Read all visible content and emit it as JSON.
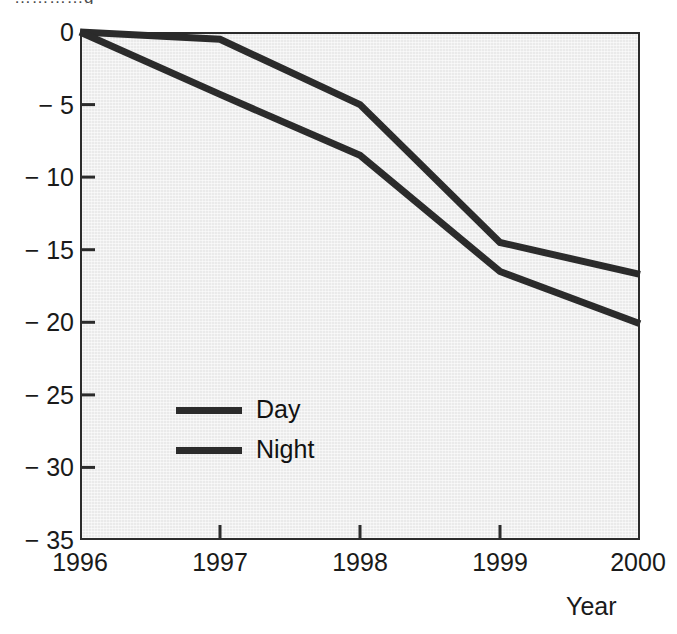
{
  "figure": {
    "title_remnant": "…………g",
    "background": "#ffffff",
    "panel_background": "#eaeaea",
    "axis_color": "#2b2b2b",
    "xaxis_title": "Year"
  },
  "legend": {
    "position": "inside-center-left",
    "entries": [
      {
        "label": "Day",
        "color": "#2b2b2b"
      },
      {
        "label": "Night",
        "color": "#2b2b2b"
      }
    ]
  },
  "axes": {
    "y_ticks": [
      "0",
      "− 5",
      "− 10",
      "− 15",
      "− 20",
      "− 25",
      "− 30",
      "− 35"
    ],
    "x_ticks": [
      "1996",
      "1997",
      "1998",
      "1999",
      "2000"
    ]
  },
  "chart_data": {
    "type": "line",
    "title": "",
    "subtitle": "",
    "xlabel": "Year",
    "ylabel": "",
    "x": [
      1996,
      1997,
      1998,
      1999,
      2000
    ],
    "xlim": [
      1996,
      2000
    ],
    "ylim": [
      -35,
      0
    ],
    "ytick_values": [
      0,
      -5,
      -10,
      -15,
      -20,
      -25,
      -30,
      -35
    ],
    "xtick_values": [
      1996,
      1997,
      1998,
      1999,
      2000
    ],
    "grid": false,
    "legend_position": "inside center-left",
    "series": [
      {
        "name": "Day",
        "color": "#2b2b2b",
        "values": [
          0,
          -0.5,
          -5.0,
          -14.5,
          -16.7
        ]
      },
      {
        "name": "Night",
        "color": "#2b2b2b",
        "values": [
          0,
          -4.3,
          -8.5,
          -16.5,
          -20.1
        ]
      }
    ]
  }
}
